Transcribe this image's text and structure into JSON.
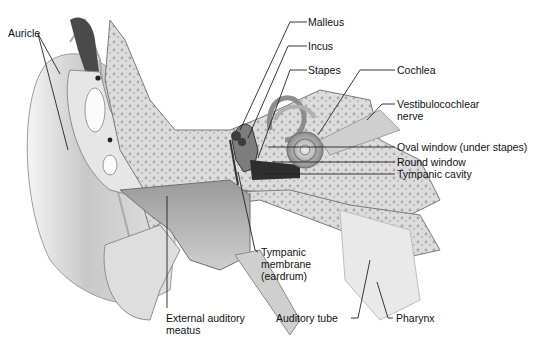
{
  "diagram": {
    "labels": {
      "auricle": "Auricle",
      "malleus": "Malleus",
      "incus": "Incus",
      "stapes": "Stapes",
      "cochlea": "Cochlea",
      "vestibulocochlear_1": "Vestibulocochlear",
      "vestibulocochlear_2": "nerve",
      "oval_window": "Oval window (under stapes)",
      "round_window": "Round window",
      "tympanic_cavity": "Tympanic cavity",
      "tympanic_membrane_1": "Tympanic",
      "tympanic_membrane_2": "membrane",
      "tympanic_membrane_3": "(eardrum)",
      "external_meatus_1": "External auditory",
      "external_meatus_2": "meatus",
      "auditory_tube": "Auditory tube",
      "pharynx": "Pharynx"
    },
    "colors": {
      "background": "#ffffff",
      "tissue_light": "#e6e6e6",
      "tissue_mid": "#bdbdbd",
      "tissue_dark": "#7a7a7a",
      "bone": "#d9d9d9",
      "leader_line": "#222222",
      "text": "#111111"
    }
  }
}
